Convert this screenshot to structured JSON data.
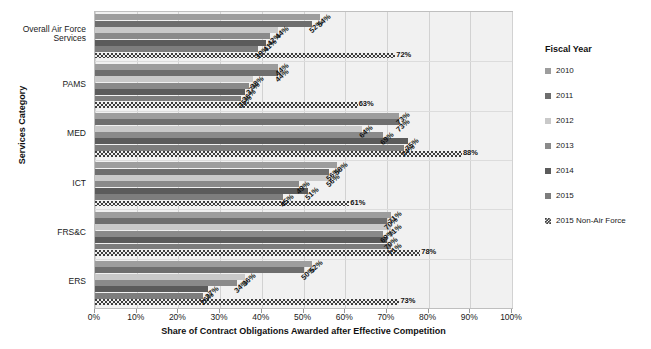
{
  "chart_data": {
    "type": "bar",
    "orientation": "horizontal",
    "title": "",
    "xlabel": "Share of Contract Obligations Awarded after Effective Competition",
    "ylabel": "Services Category",
    "xlim": [
      0,
      100
    ],
    "xticks": [
      "0%",
      "10%",
      "20%",
      "30%",
      "40%",
      "50%",
      "60%",
      "70%",
      "80%",
      "90%",
      "100%"
    ],
    "xtick_values": [
      0,
      10,
      20,
      30,
      40,
      50,
      60,
      70,
      80,
      90,
      100
    ],
    "grid": true,
    "legend_position": "right",
    "legend_title": "Fiscal Year",
    "categories": [
      "Overall Air Force Services",
      "PAMS",
      "MED",
      "ICT",
      "FRS&C",
      "ERS"
    ],
    "series": [
      {
        "name": "2010",
        "color": "#9d9d9d",
        "values": [
          54,
          44,
          73,
          58,
          71,
          52
        ]
      },
      {
        "name": "2011",
        "color": "#6e6e6e",
        "values": [
          52,
          44,
          73,
          56,
          70,
          50
        ]
      },
      {
        "name": "2012",
        "color": "#c9c9c9",
        "values": [
          44,
          38,
          64,
          56,
          71,
          36
        ]
      },
      {
        "name": "2013",
        "color": "#8a8a8a",
        "values": [
          42,
          37,
          69,
          49,
          69,
          34
        ]
      },
      {
        "name": "2014",
        "color": "#5b5b5b",
        "values": [
          41,
          36,
          75,
          51,
          70,
          27
        ]
      },
      {
        "name": "2015",
        "color": "#7d7d7d",
        "values": [
          39,
          35,
          74,
          45,
          71,
          26
        ]
      },
      {
        "name": "2015 Non-Air Force",
        "color": "#3d3d3d",
        "values": [
          72,
          63,
          88,
          61,
          78,
          73
        ]
      }
    ],
    "data_labels": [
      [
        "54%",
        "52%",
        "44%",
        "42%",
        "41%",
        "39%",
        "72%"
      ],
      [
        "44%",
        "44%",
        "38%",
        "37%",
        "36%",
        "35%",
        "63%"
      ],
      [
        "73%",
        "73%",
        "64%",
        "69%",
        "75%",
        "74%",
        "88%"
      ],
      [
        "58%",
        "56%",
        "56%",
        "49%",
        "51%",
        "45%",
        "61%"
      ],
      [
        "71%",
        "70%",
        "71%",
        "69%",
        "70%",
        "71%",
        "78%"
      ],
      [
        "52%",
        "50%",
        "36%",
        "34%",
        "27%",
        "26%",
        "73%"
      ]
    ]
  },
  "axis": {
    "y_title": "Services Category",
    "x_title": "Share of Contract Obligations Awarded after Effective Competition"
  },
  "legend": {
    "title": "Fiscal Year",
    "items": [
      {
        "label": "2010"
      },
      {
        "label": "2011"
      },
      {
        "label": "2012"
      },
      {
        "label": "2013"
      },
      {
        "label": "2014"
      },
      {
        "label": "2015"
      },
      {
        "label": "2015 Non-Air Force"
      }
    ]
  }
}
